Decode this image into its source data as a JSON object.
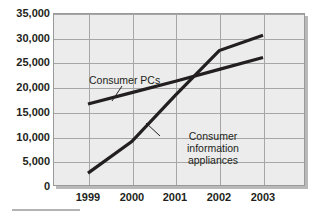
{
  "chart_data": {
    "type": "line",
    "title": "",
    "xlabel": "",
    "ylabel": "",
    "x": [
      "1999",
      "2000",
      "2001",
      "2002",
      "2003"
    ],
    "categories": [
      "1999",
      "2000",
      "2001",
      "2002",
      "2003"
    ],
    "ylim": [
      0,
      35000
    ],
    "ytick_labels": [
      "0",
      "5,000",
      "10,000",
      "15,000",
      "20,000",
      "25,000",
      "30,000",
      "35,000"
    ],
    "ytick_values": [
      0,
      5000,
      10000,
      15000,
      20000,
      25000,
      30000,
      35000
    ],
    "grid": true,
    "legend_position": "inline-annotations",
    "series": [
      {
        "name": "Consumer PCs",
        "values": [
          16600,
          18900,
          21200,
          23600,
          26000
        ],
        "color": "#231f20"
      },
      {
        "name": "Consumer information appliances",
        "values": [
          2600,
          9000,
          18400,
          27400,
          30500
        ],
        "color": "#231f20"
      }
    ],
    "annotations": [
      {
        "text": "Consumer PCs",
        "series": "Consumer PCs"
      },
      {
        "text": "Consumer information appliances",
        "series": "Consumer information appliances"
      }
    ]
  },
  "labels": {
    "consumer_pcs": "Consumer PCs",
    "consumer_info_appliances_line1": "Consumer information",
    "consumer_info_appliances_line2": "appliances"
  },
  "axis": {
    "y_ticks": [
      "35,000",
      "30,000",
      "25,000",
      "20,000",
      "15,000",
      "10,000",
      "5,000",
      "0"
    ],
    "x_ticks": [
      "1999",
      "2000",
      "2001",
      "2002",
      "2003"
    ]
  },
  "colors": {
    "plot_background": "#ececec",
    "gridline": "#a6a6a6",
    "plot_border": "#9a9a9a",
    "series_line": "#231f20",
    "text": "#231f20",
    "page_background": "#ffffff",
    "rule": "#b3b3b3"
  }
}
